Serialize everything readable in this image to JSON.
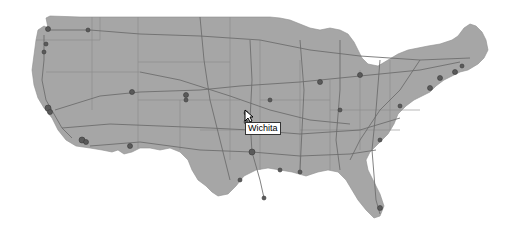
{
  "map": {
    "region": "United States (contiguous)",
    "colors": {
      "land": "#a6a6a6",
      "roads": "#6b6b6b",
      "cities": "#5a5a5a",
      "background": "#ffffff"
    }
  },
  "tooltip": {
    "label": "Wichita"
  },
  "cursor": {
    "icon": "arrow-pointer-icon"
  }
}
